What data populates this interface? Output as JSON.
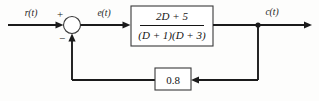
{
  "diagram": {
    "type": "control-system-block-diagram",
    "background_color": "#fdfdfc",
    "line_color": "#1b1b1b",
    "signals": {
      "input_label": "r(t)",
      "error_label": "e(t)",
      "output_label": "c(t)"
    },
    "summing_junction": {
      "name": "summing-junction",
      "positive_sign": "+",
      "negative_sign": "−",
      "cx": 72,
      "cy": 25,
      "r": 8.5
    },
    "forward_block": {
      "name": "forward-transfer-function",
      "numerator": "2D + 5",
      "denominator": "(D + 1)(D + 3)",
      "expression": "(2D + 5) / ((D + 1)(D + 3))",
      "x": 131,
      "y": 6,
      "width": 82,
      "height": 40
    },
    "feedback_block": {
      "name": "feedback-gain",
      "gain": "0.8",
      "x": 155,
      "y": 68,
      "width": 36,
      "height": 22
    },
    "takeoff_node": {
      "name": "output-takeoff-node",
      "cx": 258,
      "cy": 25,
      "r": 2.6
    },
    "wires": {
      "input_start_x": 8,
      "output_end_x": 312,
      "main_y": 25,
      "feedback_y": 80,
      "feedback_left_x": 72
    }
  }
}
